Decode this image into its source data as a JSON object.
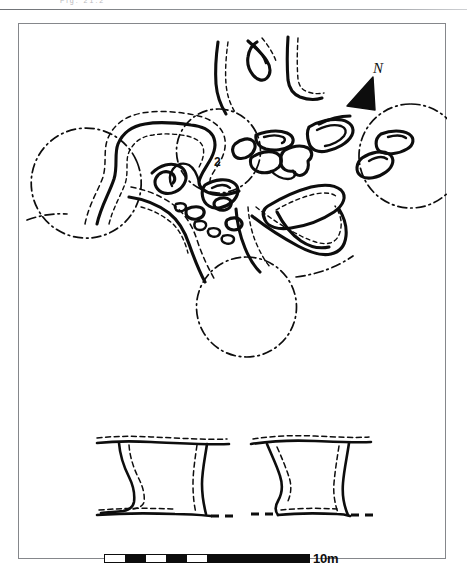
{
  "figure": {
    "type": "archaeological-site-plan",
    "caption_strip_text": "Fig.  21.2"
  },
  "annotations": {
    "north_letter": "N",
    "feature_label": "2"
  },
  "scale": {
    "label": "10m",
    "total_length_m": 10,
    "segments": [
      {
        "fill": "#ffffff",
        "length_m": 1
      },
      {
        "fill": "#0d0d0d",
        "length_m": 1
      },
      {
        "fill": "#ffffff",
        "length_m": 1
      },
      {
        "fill": "#0d0d0d",
        "length_m": 1
      },
      {
        "fill": "#ffffff",
        "length_m": 1
      },
      {
        "fill": "#0d0d0d",
        "length_m": 5
      }
    ]
  },
  "colors": {
    "ink": "#0d0d0d",
    "frame": "#85878b",
    "paper": "#ffffff",
    "scan_rule": "#7e8185"
  },
  "legend_keys": {
    "solid_outline": "excavated wall / stone line",
    "dashed_inner": "conjectured / tumble edge",
    "dash_dot_circle": "round hut / structure projection",
    "dash_dot_line": "projected feature edge"
  },
  "chart_data": {
    "type": "map",
    "title": "",
    "plan": {
      "structures_dashdot_circles": [
        {
          "name": "circle-west",
          "cx": 80,
          "cy": 162,
          "r": 55
        },
        {
          "name": "circle-east",
          "cx": 388,
          "cy": 132,
          "r": 52
        },
        {
          "name": "circle-south",
          "cx": 228,
          "cy": 283,
          "r": 50
        },
        {
          "name": "circle-centre",
          "cx": 202,
          "cy": 127,
          "r": 42
        }
      ],
      "wall_count": 22
    },
    "sections": [
      {
        "name": "section-left",
        "x": 85,
        "y": 405,
        "width": 120,
        "height": 85
      },
      {
        "name": "section-right",
        "x": 232,
        "y": 405,
        "width": 118,
        "height": 85
      }
    ]
  }
}
